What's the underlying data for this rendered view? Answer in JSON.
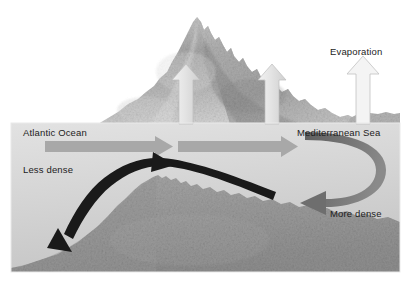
{
  "diagram": {
    "type": "cross-section-schematic",
    "canvas": {
      "width": 413,
      "height": 285
    },
    "background_color": "#ffffff"
  },
  "labels": {
    "evaporation": "Evaporation",
    "atlantic_ocean": "Atlantic Ocean",
    "mediterranean_sea": "Mediterranean Sea",
    "less_dense": "Less dense",
    "more_dense": "More dense"
  },
  "colors": {
    "water_light": "#dcdcdc",
    "water_mid": "#c9c9c9",
    "seabed": "#a0a0a0",
    "mountain_light": "#cccccc",
    "mountain_dark": "#8f8f8f",
    "surface_arrow": "#a8a8a8",
    "deep_arrow": "#6e6e6e",
    "outflow_arrow": "#1a1a1a",
    "evaporation_arrow": "#e8e8e8",
    "text": "#1c1c1c"
  },
  "flows": [
    {
      "name": "surface-inflow-west",
      "label": "Atlantic Ocean",
      "direction": "eastward",
      "depth": "surface",
      "density": "less dense",
      "color": "#a8a8a8"
    },
    {
      "name": "surface-inflow-east",
      "label": "Mediterranean Sea",
      "direction": "eastward",
      "depth": "surface",
      "density": "less dense",
      "color": "#a8a8a8"
    },
    {
      "name": "deep-outflow",
      "label": "More dense",
      "direction": "westward",
      "depth": "deep",
      "density": "more dense",
      "color": "#6e6e6e"
    },
    {
      "name": "sill-overflow",
      "label": "Less dense",
      "direction": "westward-descending",
      "depth": "deep",
      "density": "less dense",
      "color": "#1a1a1a"
    },
    {
      "name": "evaporation",
      "label": "Evaporation",
      "direction": "upward",
      "count": 3,
      "color": "#e8e8e8"
    }
  ],
  "features": [
    {
      "name": "mountain",
      "description": "textured gray mountain above waterline"
    },
    {
      "name": "underwater-sill",
      "description": "submarine ridge separating basins"
    },
    {
      "name": "coastal-shelf",
      "description": "low land at right of waterline"
    }
  ]
}
